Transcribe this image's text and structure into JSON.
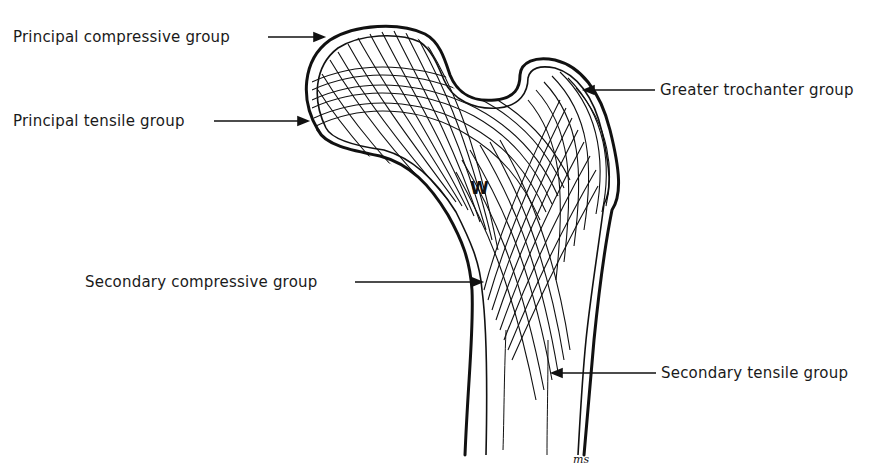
{
  "diagram": {
    "center_marker": "W",
    "labels": [
      {
        "id": "principal-compressive",
        "text": "Principal compressive group",
        "side": "left"
      },
      {
        "id": "principal-tensile",
        "text": "Principal tensile group",
        "side": "left"
      },
      {
        "id": "greater-trochanter",
        "text": "Greater trochanter group",
        "side": "right"
      },
      {
        "id": "secondary-compressive",
        "text": "Secondary compressive group",
        "side": "left"
      },
      {
        "id": "secondary-tensile",
        "text": "Secondary tensile group",
        "side": "right"
      }
    ],
    "signature": "ms",
    "colors": {
      "ink": "#111111",
      "background": "#ffffff"
    }
  }
}
